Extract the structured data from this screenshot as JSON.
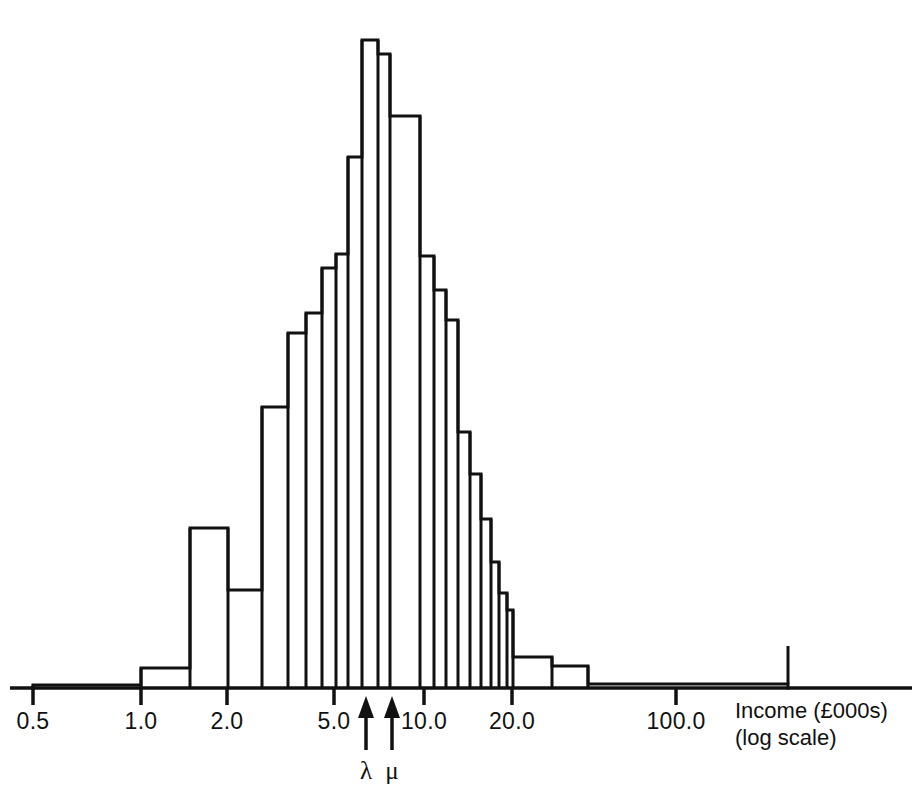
{
  "figure": {
    "background_color": "#ffffff",
    "ink_color": "#111111",
    "axis_title_line1": "Income (£000s)",
    "axis_title_line2": "(log scale)"
  },
  "annotations": [
    {
      "name": "lambda",
      "symbol": "λ",
      "x_value": 5.75,
      "px": 366
    },
    {
      "name": "mu",
      "symbol": "μ",
      "x_value": 7.0,
      "px": 392
    }
  ],
  "chart_data": {
    "type": "bar",
    "subtype": "histogram",
    "title": "",
    "xlabel": "Income (£000s) (log scale)",
    "ylabel": "",
    "xscale": "log",
    "grid": false,
    "legend": null,
    "axis_ticks": [
      0.5,
      1.0,
      2.0,
      5.0,
      10.0,
      20.0,
      100.0
    ],
    "axis_tick_labels": [
      "0.5",
      "1.0",
      "2.0",
      "5.0",
      "10.0",
      "20.0",
      "100.0"
    ],
    "xlim": [
      0.5,
      260.0
    ],
    "ylim": [
      0,
      100
    ],
    "baseline_px": 688,
    "bins_px": [
      {
        "x0": 33,
        "x1": 141,
        "top": 685,
        "height": 3
      },
      {
        "x0": 141,
        "x1": 190,
        "top": 668,
        "height": 20
      },
      {
        "x0": 190,
        "x1": 228,
        "top": 528,
        "height": 160
      },
      {
        "x0": 228,
        "x1": 262,
        "top": 590,
        "height": 98
      },
      {
        "x0": 262,
        "x1": 288,
        "top": 407,
        "height": 281
      },
      {
        "x0": 288,
        "x1": 306,
        "top": 333,
        "height": 355
      },
      {
        "x0": 306,
        "x1": 322,
        "top": 313,
        "height": 375
      },
      {
        "x0": 322,
        "x1": 336,
        "top": 268,
        "height": 420
      },
      {
        "x0": 336,
        "x1": 348,
        "top": 254,
        "height": 434
      },
      {
        "x0": 348,
        "x1": 362,
        "top": 157,
        "height": 531
      },
      {
        "x0": 362,
        "x1": 378,
        "top": 40,
        "height": 648
      },
      {
        "x0": 378,
        "x1": 390,
        "top": 54,
        "height": 634
      },
      {
        "x0": 390,
        "x1": 420,
        "top": 116,
        "height": 572
      },
      {
        "x0": 420,
        "x1": 434,
        "top": 256,
        "height": 432
      },
      {
        "x0": 434,
        "x1": 446,
        "top": 290,
        "height": 398
      },
      {
        "x0": 446,
        "x1": 458,
        "top": 320,
        "height": 368
      },
      {
        "x0": 458,
        "x1": 470,
        "top": 432,
        "height": 256
      },
      {
        "x0": 470,
        "x1": 481,
        "top": 474,
        "height": 214
      },
      {
        "x0": 481,
        "x1": 491,
        "top": 519,
        "height": 169
      },
      {
        "x0": 491,
        "x1": 499,
        "top": 562,
        "height": 126
      },
      {
        "x0": 499,
        "x1": 507,
        "top": 593,
        "height": 95
      },
      {
        "x0": 507,
        "x1": 513,
        "top": 610,
        "height": 78
      },
      {
        "x0": 513,
        "x1": 552,
        "top": 657,
        "height": 31
      },
      {
        "x0": 552,
        "x1": 588,
        "top": 666,
        "height": 22
      },
      {
        "x0": 588,
        "x1": 788,
        "top": 684,
        "height": 4
      }
    ],
    "bins_data": [
      {
        "x_left": 0.5,
        "x_right": 1.0,
        "density": 0.5
      },
      {
        "x_left": 1.0,
        "x_right": 1.4,
        "density": 3.1
      },
      {
        "x_left": 1.4,
        "x_right": 1.8,
        "density": 24.7
      },
      {
        "x_left": 1.8,
        "x_right": 2.2,
        "density": 15.1
      },
      {
        "x_left": 2.2,
        "x_right": 2.6,
        "density": 43.4
      },
      {
        "x_left": 2.6,
        "x_right": 3.0,
        "density": 54.8
      },
      {
        "x_left": 3.0,
        "x_right": 3.4,
        "density": 57.9
      },
      {
        "x_left": 3.4,
        "x_right": 3.8,
        "density": 64.8
      },
      {
        "x_left": 3.8,
        "x_right": 4.2,
        "density": 67.0
      },
      {
        "x_left": 4.2,
        "x_right": 4.8,
        "density": 81.9
      },
      {
        "x_left": 4.8,
        "x_right": 5.6,
        "density": 100.0
      },
      {
        "x_left": 5.6,
        "x_right": 6.2,
        "density": 97.8
      },
      {
        "x_left": 6.2,
        "x_right": 8.0,
        "density": 88.3
      },
      {
        "x_left": 8.0,
        "x_right": 9.0,
        "density": 66.7
      },
      {
        "x_left": 9.0,
        "x_right": 10.0,
        "density": 61.4
      },
      {
        "x_left": 10.0,
        "x_right": 11.0,
        "density": 56.8
      },
      {
        "x_left": 11.0,
        "x_right": 12.0,
        "density": 39.5
      },
      {
        "x_left": 12.0,
        "x_right": 13.0,
        "density": 33.0
      },
      {
        "x_left": 13.0,
        "x_right": 14.5,
        "density": 26.1
      },
      {
        "x_left": 14.5,
        "x_right": 16.0,
        "density": 19.4
      },
      {
        "x_left": 16.0,
        "x_right": 17.5,
        "density": 14.7
      },
      {
        "x_left": 17.5,
        "x_right": 19.0,
        "density": 12.0
      },
      {
        "x_left": 19.0,
        "x_right": 26.0,
        "density": 4.8
      },
      {
        "x_left": 26.0,
        "x_right": 34.0,
        "density": 3.4
      },
      {
        "x_left": 34.0,
        "x_right": 200.0,
        "density": 0.6
      }
    ]
  }
}
